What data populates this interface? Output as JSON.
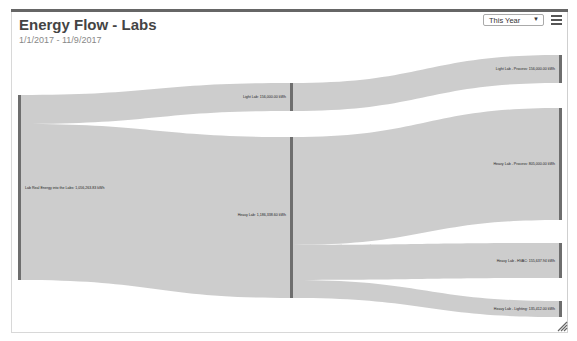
{
  "header": {
    "title": "Energy Flow - Labs",
    "date_range": "1/1/2017 - 11/9/2017",
    "period_select": {
      "selected": "This Year"
    },
    "menu_icon": "hamburger-menu-icon"
  },
  "diagram": {
    "type": "sankey",
    "unit": "kWh",
    "colors": {
      "node": "#6e6e6e",
      "link": "#c8c8c8",
      "frame_top": "#666666"
    },
    "nodes": [
      {
        "id": "source",
        "label": "Lab Real Energy into the Labs: 1,056,263.83 kWh"
      },
      {
        "id": "light",
        "label": "Light Lab: 156,000.00 kWh"
      },
      {
        "id": "heavy",
        "label": "Heavy Lab: 1,186,338.60 kWh"
      },
      {
        "id": "light_process",
        "label": "Light Lab - Process: 156,000.00 kWh"
      },
      {
        "id": "heavy_process",
        "label": "Heavy Lab - Process: 805,000.00 kWh"
      },
      {
        "id": "heavy_hvac",
        "label": "Heavy Lab - HVAC: 155,637.94 kWh"
      },
      {
        "id": "heavy_lighting",
        "label": "Heavy Lab - Lighting: 135,412.00 kWh"
      }
    ],
    "links": [
      {
        "source": "source",
        "target": "light"
      },
      {
        "source": "source",
        "target": "heavy"
      },
      {
        "source": "light",
        "target": "light_process"
      },
      {
        "source": "heavy",
        "target": "heavy_process"
      },
      {
        "source": "heavy",
        "target": "heavy_hvac"
      },
      {
        "source": "heavy",
        "target": "heavy_lighting"
      }
    ]
  }
}
